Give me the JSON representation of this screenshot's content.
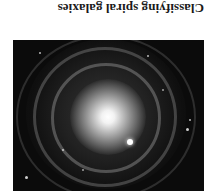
{
  "caption": {
    "text": "Classifying spiral galaxies",
    "orientation": "rotated 180 degrees"
  },
  "image": {
    "subject": "spiral-galaxy",
    "description": "Grayscale photograph of a face-on spiral galaxy with a bright central core and concentric ring-like spiral arms on a dark background",
    "background_color": "#0b0b0b",
    "core_color": "#ffffff"
  }
}
